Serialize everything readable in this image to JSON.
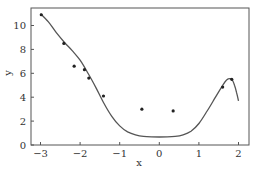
{
  "chart_data": {
    "type": "scatter",
    "title": "",
    "xlabel": "x",
    "ylabel": "y",
    "xlim": [
      -3.25,
      2.27
    ],
    "ylim": [
      0,
      11.5
    ],
    "xticks": [
      -3,
      -2,
      -1,
      0,
      1,
      2
    ],
    "yticks": [
      0,
      2,
      4,
      6,
      8,
      10
    ],
    "grid": false,
    "legend": null,
    "series": [
      {
        "name": "data points",
        "kind": "scatter",
        "x": [
          -2.98,
          -2.41,
          -2.15,
          -1.89,
          -1.78,
          -1.41,
          -0.44,
          0.35,
          1.6,
          1.83
        ],
        "y": [
          10.9,
          8.5,
          6.6,
          6.3,
          5.6,
          4.1,
          3.0,
          2.85,
          4.85,
          5.5
        ]
      },
      {
        "name": "fitted curve",
        "kind": "line",
        "x": [
          -3.0,
          -2.8,
          -2.6,
          -2.4,
          -2.2,
          -2.0,
          -1.8,
          -1.6,
          -1.4,
          -1.2,
          -1.0,
          -0.8,
          -0.6,
          -0.4,
          -0.2,
          0.0,
          0.2,
          0.4,
          0.6,
          0.8,
          1.0,
          1.2,
          1.4,
          1.6,
          1.7,
          1.8,
          1.85,
          1.9,
          1.95,
          2.0
        ],
        "y": [
          11.0,
          10.3,
          9.4,
          8.6,
          7.9,
          7.1,
          6.0,
          4.8,
          3.5,
          2.4,
          1.6,
          1.1,
          0.85,
          0.72,
          0.68,
          0.67,
          0.68,
          0.72,
          0.85,
          1.15,
          1.8,
          2.8,
          3.9,
          5.0,
          5.45,
          5.55,
          5.4,
          5.0,
          4.4,
          3.7
        ]
      }
    ]
  },
  "colors": {
    "axis": "#555555",
    "line": "#555555",
    "marker": "#222222"
  }
}
